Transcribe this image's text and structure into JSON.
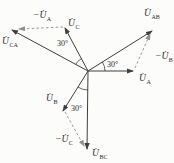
{
  "figure": {
    "type": "three-phase-voltage-phasor-diagram",
    "colors": {
      "background": "#fcfcfa",
      "solid_line": "#3f3f3f",
      "dashed_line": "#8f8f8f",
      "text": "#2d2d2d"
    },
    "labels": {
      "u_ca": {
        "main": "U̇",
        "sub": "CA"
      },
      "minus_u_a": {
        "main": "−U̇",
        "sub": "A"
      },
      "u_c": {
        "main": "U̇",
        "sub": "C"
      },
      "u_ab": {
        "main": "U̇",
        "sub": "AB"
      },
      "minus_u_b": {
        "main": "−U̇",
        "sub": "B"
      },
      "u_a": {
        "main": "U̇",
        "sub": "A"
      },
      "u_b": {
        "main": "U̇",
        "sub": "B"
      },
      "minus_u_c": {
        "main": "−U̇",
        "sub": "C"
      },
      "u_bc": {
        "main": "U̇",
        "sub": "BC"
      }
    },
    "angles": [
      "30°",
      "30°",
      "30°"
    ]
  }
}
